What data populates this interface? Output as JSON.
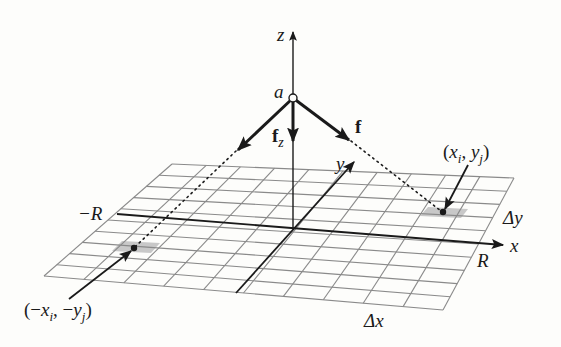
{
  "figure": {
    "colors": {
      "background": "#fdfdfb",
      "ink": "#1a1a1a",
      "grid": "#8a8a8a",
      "shaded_cell": "#c8c8c8"
    },
    "grid": {
      "corners": {
        "top_left": [
          172,
          164
        ],
        "top_right": [
          514,
          178
        ],
        "bottom_right": [
          443,
          310
        ],
        "bottom_left": [
          44,
          276
        ]
      },
      "columns": 10,
      "rows": 10
    },
    "axes": {
      "origin": [
        293,
        229
      ],
      "z": {
        "label": "z",
        "from": [
          293,
          229
        ],
        "to": [
          293,
          30
        ]
      },
      "x": {
        "label": "x",
        "from": [
          117,
          214
        ],
        "to": [
          505,
          245
        ]
      },
      "y": {
        "label": "y",
        "from": [
          236,
          293
        ],
        "to": [
          355,
          161
        ]
      }
    },
    "point_a": {
      "label": "a",
      "pos": [
        293,
        98
      ]
    },
    "vectors": {
      "f": {
        "label": "f",
        "to": [
          351,
          141
        ]
      },
      "f_left": {
        "to": [
          236,
          151
        ]
      },
      "fz": {
        "label": "f",
        "subscript": "z",
        "to": [
          293,
          142
        ]
      }
    },
    "labels": {
      "neg_R": "−R",
      "R": "R",
      "delta_x": "Δx",
      "delta_y": "Δy",
      "point_pos": {
        "open": "(",
        "x": "x",
        "xsub": "i",
        "sep": ", ",
        "y": "y",
        "ysub": "j",
        "close": ")"
      },
      "point_neg": {
        "open": "(−",
        "x": "x",
        "xsub": "i",
        "sep": ", −",
        "y": "y",
        "ysub": "j",
        "close": ")"
      }
    },
    "cells": {
      "positive": {
        "label": "(x_i, y_j)",
        "dot": [
          443,
          212
        ]
      },
      "negative": {
        "label": "(−x_i, −y_j)",
        "dot": [
          134,
          248
        ]
      }
    }
  }
}
